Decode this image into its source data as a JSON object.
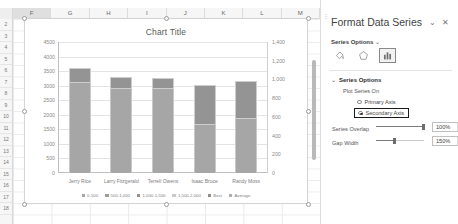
{
  "spreadsheet": {
    "column_headers": [
      "F",
      "G",
      "H",
      "I",
      "J",
      "K",
      "L",
      "M"
    ],
    "selected_column": "F",
    "row_headers": [
      "2",
      "3",
      "4",
      "5",
      "6",
      "7",
      "8",
      "9",
      "10",
      "11",
      "12",
      "13",
      "14",
      "15",
      "16",
      "17",
      "18"
    ]
  },
  "chart_data": {
    "type": "bar",
    "title": "Chart Title",
    "xlabel": "",
    "ylabel": "",
    "grid": true,
    "legend_position": "bottom",
    "categories": [
      "Jerry Rice",
      "Larry Fitzgerald",
      "Terrell Owens",
      "Isaac Bruce",
      "Randy Moss"
    ],
    "primary_axis": {
      "ticks": [
        "0",
        "500",
        "1000",
        "1500",
        "2000",
        "2500",
        "3000",
        "3500",
        "4000",
        "4500"
      ],
      "values": [
        0,
        500,
        1000,
        1500,
        2000,
        2500,
        3000,
        3500,
        4000,
        4500
      ],
      "ylim": [
        0,
        4500
      ]
    },
    "secondary_axis": {
      "ticks": [
        "0",
        "200",
        "400",
        "600",
        "800",
        "1,000",
        "1,200",
        "1,400"
      ],
      "values": [
        0,
        200,
        400,
        600,
        800,
        1000,
        1200,
        1400
      ],
      "ylim": [
        0,
        1400
      ]
    },
    "series": [
      {
        "name": "Receptions",
        "axis": "primary",
        "color": "#a6a6a6",
        "values": [
          3600,
          3300,
          3280,
          3020,
          3150
        ]
      },
      {
        "name": "Secondary",
        "axis": "secondary",
        "color": "#949494",
        "values": [
          160,
          130,
          120,
          430,
          400
        ]
      }
    ],
    "legend": [
      {
        "label": "0-500",
        "color": "#a6a6a6"
      },
      {
        "label": "500-1,000",
        "color": "#9c9c9c"
      },
      {
        "label": "1,000-1,500",
        "color": "#949494"
      },
      {
        "label": "1,500-2,000",
        "color": "#c9c9c9"
      },
      {
        "label": "Best",
        "color": "#8e8e8e"
      },
      {
        "label": "Average",
        "color": "#b0b0b0"
      }
    ]
  },
  "pane": {
    "title": "Format Data Series",
    "collapse_label": "⌄",
    "close_label": "✕",
    "options_dropdown": "Series Options",
    "options_chevron": "⌄",
    "tools": [
      {
        "name": "fill-icon",
        "selected": false
      },
      {
        "name": "effects-icon",
        "selected": false
      },
      {
        "name": "series-options-icon",
        "selected": true
      }
    ],
    "section_title": "Series Options",
    "section_chevron": "⌄",
    "plot_series_on_label": "Plot Series On",
    "primary_axis_label": "Primary Axis",
    "secondary_axis_label": "Secondary Axis",
    "primary_axis_selected": false,
    "secondary_axis_selected": true,
    "series_overlap_label": "Series Overlap",
    "series_overlap_value": "100%",
    "gap_width_label": "Gap Width",
    "gap_width_value": "150%",
    "spin_up": "▲",
    "spin_dn": "▼"
  }
}
